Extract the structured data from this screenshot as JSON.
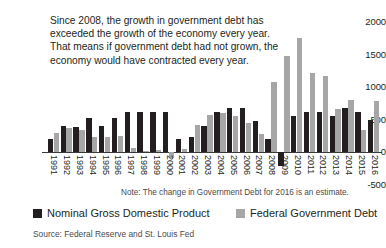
{
  "chart_data": {
    "type": "bar",
    "title": "",
    "subtitle": "",
    "xlabel": "",
    "ylabel": "",
    "ylim": [
      -500,
      2000
    ],
    "yticks": [
      -500,
      0,
      500,
      1000,
      1500,
      2000
    ],
    "grid": false,
    "legend_position": "bottom",
    "categories": [
      "1991",
      "1992",
      "1993",
      "1994",
      "1995",
      "1996",
      "1997",
      "1998",
      "1999",
      "2000",
      "2001",
      "2002",
      "2003",
      "2004",
      "2005",
      "2006",
      "2007",
      "2008",
      "2009",
      "2010",
      "2011",
      "2012",
      "2013",
      "2014",
      "2015",
      "2016"
    ],
    "series": [
      {
        "name": "Nominal Gross Domestic Product",
        "color": "#231f20",
        "values": [
          195,
          400,
          390,
          530,
          400,
          530,
          610,
          620,
          620,
          620,
          195,
          230,
          400,
          620,
          680,
          680,
          480,
          195,
          -210,
          555,
          610,
          620,
          555,
          680,
          610,
          490
        ]
      },
      {
        "name": "Federal Government Debt",
        "color": "#a6a6a6",
        "values": [
          290,
          375,
          340,
          225,
          235,
          245,
          60,
          20,
          30,
          -95,
          45,
          420,
          570,
          600,
          555,
          450,
          270,
          1075,
          1480,
          1750,
          1220,
          1170,
          660,
          800,
          340,
          780
        ]
      }
    ],
    "annotations": [
      "Since 2008, the growth in government debt has exceeded the growth of the economy every year. That means if government debt had not grown, the economy would have contracted every year.",
      "Note: The change in Government Debt for 2016 is an estimate.",
      "Source: Federal Reserve and St. Louis Fed"
    ]
  },
  "annotation": {
    "text": "Since 2008, the growth in government debt has exceeded the growth of the economy every year. That means if government debt had not grown, the economy would have contracted every year."
  },
  "note": {
    "text": "Note: The change in Government Debt for 2016 is an estimate."
  },
  "legend": {
    "items": [
      {
        "label": "Nominal Gross Domestic Product",
        "color": "#231f20"
      },
      {
        "label": "Federal Government Debt",
        "color": "#a6a6a6"
      }
    ]
  },
  "source": {
    "text": "Source: Federal Reserve and St. Louis Fed"
  }
}
